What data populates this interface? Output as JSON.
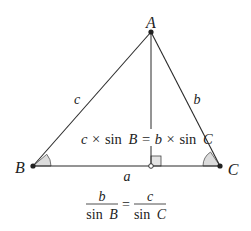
{
  "diagram": {
    "vertices": {
      "A": {
        "label": "A",
        "x": 151,
        "y": 32
      },
      "B": {
        "label": "B",
        "x": 33,
        "y": 166
      },
      "C": {
        "label": "C",
        "x": 220,
        "y": 166
      }
    },
    "foot": {
      "x": 151,
      "y": 166
    },
    "sides": {
      "a": {
        "label": "a"
      },
      "b": {
        "label": "b"
      },
      "c": {
        "label": "c"
      }
    },
    "equation1": {
      "lhs_var": "c",
      "times1": "×",
      "sin1": "sin",
      "angle1": "B",
      "equals": "=",
      "rhs_var": "b",
      "times2": "×",
      "sin2": "sin",
      "angle2": "C"
    },
    "equation2": {
      "num_left": "b",
      "den_left_sin": "sin",
      "den_left_angle": "B",
      "equals": "=",
      "num_right": "c",
      "den_right_sin": "sin",
      "den_right_angle": "C"
    },
    "colors": {
      "line": "#2a2a2a",
      "angle_fill": "#dcdcdc",
      "point": "#222222"
    }
  }
}
